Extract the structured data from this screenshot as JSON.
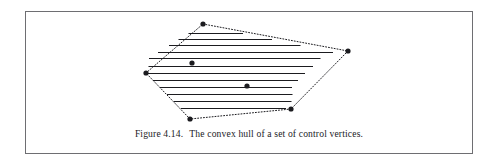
{
  "figure": {
    "caption_label": "Figure 4.14.",
    "caption_text": "The convex hull of a set of control vertices.",
    "frame": {
      "x": 25,
      "y": 11,
      "width": 448,
      "height": 143,
      "border_color": "#6e6e72"
    },
    "background_color": "#ffffff",
    "ink_color": "#1b1b1f"
  },
  "chart_data": {
    "type": "scatter",
    "title": "The convex hull of a set of control vertices.",
    "xlabel": "",
    "ylabel": "",
    "grid": false,
    "legend": "none",
    "xlim": [
      140,
      360
    ],
    "ylim": [
      18,
      126
    ],
    "hull_vertices": [
      {
        "name": "top",
        "x": 203,
        "y": 24
      },
      {
        "name": "right",
        "x": 348,
        "y": 51
      },
      {
        "name": "bottom-right",
        "x": 291,
        "y": 109
      },
      {
        "name": "bottom-left",
        "x": 190,
        "y": 119
      },
      {
        "name": "left",
        "x": 146,
        "y": 73
      }
    ],
    "interior_points": [
      {
        "name": "interior-upper",
        "x": 192,
        "y": 63
      },
      {
        "name": "interior-lower",
        "x": 247,
        "y": 86
      }
    ],
    "hull_edge_style": "dotted",
    "point_marker": "filled-circle",
    "point_radius": 2.6,
    "scan_lines": [
      {
        "y": 33.5,
        "x1": 188.5,
        "x2": 243.0
      },
      {
        "y": 39.5,
        "x1": 178.5,
        "x2": 272.0
      },
      {
        "y": 45.5,
        "x1": 169.0,
        "x2": 300.5
      },
      {
        "y": 52.5,
        "x1": 158.0,
        "x2": 333.0
      },
      {
        "y": 58.5,
        "x1": 149.0,
        "x2": 320.5
      },
      {
        "y": 66.5,
        "x1": 148.5,
        "x2": 313.0
      },
      {
        "y": 73.5,
        "x1": 146.5,
        "x2": 305.0
      },
      {
        "y": 80.5,
        "x1": 153.0,
        "x2": 298.0
      },
      {
        "y": 87.5,
        "x1": 160.0,
        "x2": 292.0
      },
      {
        "y": 94.5,
        "x1": 167.0,
        "x2": 292.5
      },
      {
        "y": 101.5,
        "x1": 174.0,
        "x2": 291.5
      },
      {
        "y": 108.5,
        "x1": 181.0,
        "x2": 286.0
      }
    ]
  }
}
